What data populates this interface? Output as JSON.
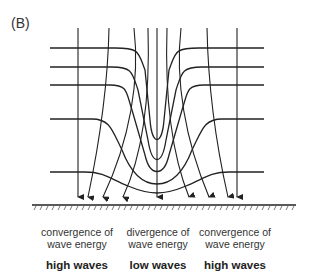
{
  "panel_label": "(B)",
  "captions": [
    {
      "line1": "convergence of",
      "line2": "wave energy",
      "result": "high waves"
    },
    {
      "line1": "divergence of",
      "line2": "wave energy",
      "result": "low waves"
    },
    {
      "line1": "convergence of",
      "line2": "wave energy",
      "result": "high waves"
    }
  ],
  "colors": {
    "line": "#222222",
    "background": "#ffffff"
  }
}
